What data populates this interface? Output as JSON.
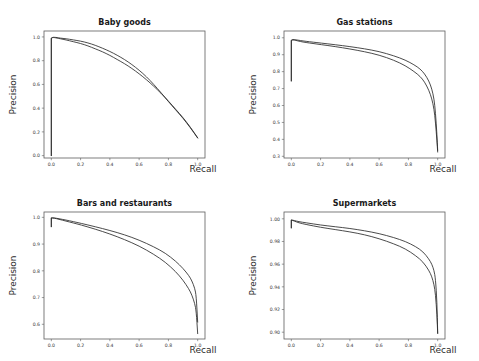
{
  "figure": {
    "width": 479,
    "height": 361,
    "background": "#ffffff",
    "curve_color": "#2b2b2b",
    "frame_color": "#5d5d5d",
    "layout": "2x2 grid of precision-recall subplots"
  },
  "chart_data": [
    {
      "type": "line",
      "title": "Baby goods",
      "xlabel": "Recall",
      "ylabel": "Precision",
      "xlim": [
        -0.05,
        1.05
      ],
      "ylim": [
        -0.02,
        1.05
      ],
      "xticks": [
        0.0,
        0.2,
        0.4,
        0.6,
        0.8,
        1.0
      ],
      "xticklabels": [
        "0.0",
        "0.2",
        "0.4",
        "0.6",
        "0.8",
        "1.0"
      ],
      "yticks": [
        0.0,
        0.2,
        0.4,
        0.6,
        0.8,
        1.0
      ],
      "yticklabels": [
        "0.0",
        "0.2",
        "0.4",
        "0.6",
        "0.8",
        "1.0"
      ],
      "grid": false,
      "legend": null,
      "series": [
        {
          "name": "curve-a",
          "x": [
            0.0,
            0.0,
            0.01,
            0.02,
            0.04,
            0.06,
            0.1,
            0.15,
            0.2,
            0.25,
            0.3,
            0.35,
            0.4,
            0.45,
            0.5,
            0.55,
            0.6,
            0.65,
            0.7,
            0.75,
            0.8,
            0.85,
            0.9,
            0.95,
            1.0
          ],
          "y": [
            0.0,
            0.99,
            0.995,
            0.995,
            0.99,
            0.985,
            0.975,
            0.96,
            0.945,
            0.925,
            0.9,
            0.875,
            0.845,
            0.81,
            0.775,
            0.735,
            0.69,
            0.64,
            0.585,
            0.525,
            0.46,
            0.39,
            0.32,
            0.24,
            0.15
          ]
        },
        {
          "name": "curve-b",
          "x": [
            0.0,
            0.0,
            0.01,
            0.02,
            0.04,
            0.06,
            0.1,
            0.15,
            0.2,
            0.25,
            0.3,
            0.35,
            0.4,
            0.45,
            0.5,
            0.55,
            0.6,
            0.65,
            0.7,
            0.75,
            0.8,
            0.85,
            0.9,
            0.95,
            1.0
          ],
          "y": [
            0.0,
            0.99,
            0.997,
            0.997,
            0.995,
            0.99,
            0.985,
            0.975,
            0.965,
            0.95,
            0.93,
            0.905,
            0.878,
            0.846,
            0.81,
            0.768,
            0.72,
            0.665,
            0.6,
            0.53,
            0.455,
            0.385,
            0.315,
            0.235,
            0.148
          ]
        }
      ]
    },
    {
      "type": "line",
      "title": "Gas stations",
      "xlabel": "Recall",
      "ylabel": "Precision",
      "xlim": [
        -0.05,
        1.05
      ],
      "ylim": [
        0.29,
        1.04
      ],
      "xticks": [
        0.0,
        0.2,
        0.4,
        0.6,
        0.8,
        1.0
      ],
      "xticklabels": [
        "0.0",
        "0.2",
        "0.4",
        "0.6",
        "0.8",
        "1.0"
      ],
      "yticks": [
        0.3,
        0.4,
        0.5,
        0.6,
        0.7,
        0.8,
        0.9,
        1.0
      ],
      "yticklabels": [
        "0.3",
        "0.4",
        "0.5",
        "0.6",
        "0.7",
        "0.8",
        "0.9",
        "1.0"
      ],
      "grid": false,
      "legend": null,
      "series": [
        {
          "name": "curve-a",
          "x": [
            0.0,
            0.0,
            0.01,
            0.03,
            0.06,
            0.1,
            0.15,
            0.2,
            0.3,
            0.4,
            0.5,
            0.6,
            0.7,
            0.78,
            0.84,
            0.88,
            0.91,
            0.94,
            0.96,
            0.975,
            0.985,
            0.995,
            1.0
          ],
          "y": [
            0.745,
            0.985,
            0.988,
            0.985,
            0.978,
            0.972,
            0.966,
            0.96,
            0.948,
            0.934,
            0.918,
            0.898,
            0.868,
            0.835,
            0.8,
            0.772,
            0.74,
            0.69,
            0.64,
            0.58,
            0.5,
            0.39,
            0.325
          ]
        },
        {
          "name": "curve-b",
          "x": [
            0.0,
            0.0,
            0.01,
            0.03,
            0.06,
            0.1,
            0.15,
            0.2,
            0.3,
            0.4,
            0.5,
            0.6,
            0.7,
            0.78,
            0.84,
            0.88,
            0.91,
            0.94,
            0.96,
            0.975,
            0.985,
            0.995,
            1.0
          ],
          "y": [
            0.745,
            0.985,
            0.99,
            0.988,
            0.984,
            0.979,
            0.974,
            0.969,
            0.959,
            0.948,
            0.935,
            0.919,
            0.894,
            0.868,
            0.84,
            0.816,
            0.788,
            0.745,
            0.698,
            0.64,
            0.558,
            0.425,
            0.335
          ]
        }
      ]
    },
    {
      "type": "line",
      "title": "Bars and restaurants",
      "xlabel": "Recall",
      "ylabel": "Precision",
      "xlim": [
        -0.05,
        1.05
      ],
      "ylim": [
        0.545,
        1.02
      ],
      "xticks": [
        0.0,
        0.2,
        0.4,
        0.6,
        0.8,
        1.0
      ],
      "xticklabels": [
        "0.0",
        "0.2",
        "0.4",
        "0.6",
        "0.8",
        "1.0"
      ],
      "yticks": [
        0.6,
        0.7,
        0.8,
        0.9,
        1.0
      ],
      "yticklabels": [
        "0.6",
        "0.7",
        "0.8",
        "0.9",
        "1.0"
      ],
      "grid": false,
      "legend": null,
      "series": [
        {
          "name": "curve-a",
          "x": [
            0.0,
            0.0,
            0.02,
            0.05,
            0.1,
            0.15,
            0.2,
            0.3,
            0.4,
            0.5,
            0.6,
            0.7,
            0.78,
            0.85,
            0.9,
            0.94,
            0.96,
            0.98,
            0.99,
            1.0
          ],
          "y": [
            0.965,
            0.998,
            0.997,
            0.993,
            0.986,
            0.979,
            0.972,
            0.956,
            0.938,
            0.917,
            0.893,
            0.862,
            0.832,
            0.797,
            0.765,
            0.732,
            0.71,
            0.678,
            0.648,
            0.565
          ]
        },
        {
          "name": "curve-b",
          "x": [
            0.0,
            0.0,
            0.02,
            0.05,
            0.1,
            0.15,
            0.2,
            0.3,
            0.4,
            0.5,
            0.6,
            0.7,
            0.78,
            0.85,
            0.9,
            0.94,
            0.96,
            0.98,
            0.99,
            1.0
          ],
          "y": [
            0.965,
            0.998,
            0.998,
            0.995,
            0.99,
            0.984,
            0.978,
            0.965,
            0.951,
            0.935,
            0.915,
            0.89,
            0.866,
            0.836,
            0.809,
            0.782,
            0.763,
            0.735,
            0.706,
            0.608
          ]
        }
      ]
    },
    {
      "type": "line",
      "title": "Supermarkets",
      "xlabel": "Recall",
      "ylabel": "Precision",
      "xlim": [
        -0.05,
        1.05
      ],
      "ylim": [
        0.894,
        1.006
      ],
      "xticks": [
        0.0,
        0.2,
        0.4,
        0.6,
        0.8,
        1.0
      ],
      "xticklabels": [
        "0.0",
        "0.2",
        "0.4",
        "0.6",
        "0.8",
        "1.0"
      ],
      "yticks": [
        0.9,
        0.92,
        0.94,
        0.96,
        0.98,
        1.0
      ],
      "yticklabels": [
        "0.90",
        "0.92",
        "0.94",
        "0.96",
        "0.98",
        "1.00"
      ],
      "grid": false,
      "legend": null,
      "series": [
        {
          "name": "curve-a",
          "x": [
            0.0,
            0.0,
            0.02,
            0.05,
            0.1,
            0.2,
            0.3,
            0.4,
            0.5,
            0.6,
            0.7,
            0.78,
            0.85,
            0.9,
            0.94,
            0.96,
            0.975,
            0.985,
            0.995,
            1.0
          ],
          "y": [
            0.992,
            0.999,
            0.998,
            0.9965,
            0.995,
            0.9925,
            0.9905,
            0.9885,
            0.986,
            0.9825,
            0.978,
            0.9735,
            0.9675,
            0.962,
            0.9545,
            0.949,
            0.942,
            0.9335,
            0.915,
            0.899
          ]
        },
        {
          "name": "curve-b",
          "x": [
            0.0,
            0.0,
            0.02,
            0.05,
            0.1,
            0.2,
            0.3,
            0.4,
            0.5,
            0.6,
            0.7,
            0.78,
            0.85,
            0.9,
            0.94,
            0.96,
            0.975,
            0.985,
            0.995,
            1.0
          ],
          "y": [
            0.992,
            0.999,
            0.9985,
            0.9975,
            0.9965,
            0.9945,
            0.993,
            0.9915,
            0.9895,
            0.987,
            0.9835,
            0.98,
            0.9755,
            0.971,
            0.9645,
            0.96,
            0.9545,
            0.947,
            0.927,
            0.899
          ]
        }
      ]
    }
  ]
}
